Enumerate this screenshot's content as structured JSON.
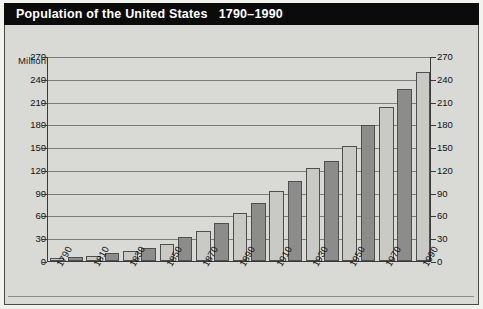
{
  "title": {
    "text": "Population of the United States   1790–1990"
  },
  "axis_unit_label": "Millions",
  "colors": {
    "title_bar_background": "#0b0b0b",
    "title_text": "#ffffff",
    "panel_background": "#d9d9d5",
    "plot_background": "#d9d9d5",
    "gridline": "#7d7d78",
    "axis_line": "#3a3a3a",
    "bar_light": "#c9c9c5",
    "bar_dark": "#8c8c8a",
    "bar_outline": "#4e4e4e",
    "tick_text": "#111111"
  },
  "chart_data": {
    "type": "bar",
    "title": "Population of the United States   1790–1990",
    "xlabel": "",
    "ylabel": "Millions",
    "ylim": [
      0,
      270
    ],
    "yticks": [
      0,
      30,
      60,
      90,
      120,
      150,
      180,
      210,
      240,
      270
    ],
    "ytick_labels": [
      "0",
      "30",
      "60",
      "90",
      "120",
      "150",
      "180",
      "210",
      "240",
      "270"
    ],
    "grid": true,
    "grid_axis": "y",
    "legend": false,
    "dual_y_axis": true,
    "right_ytick_labels": [
      "0",
      "30",
      "60",
      "90",
      "120",
      "150",
      "180",
      "210",
      "240",
      "270"
    ],
    "categories": [
      "1790",
      "1800",
      "1810",
      "1820",
      "1830",
      "1840",
      "1850",
      "1860",
      "1870",
      "1880",
      "1890",
      "1900",
      "1910",
      "1920",
      "1930",
      "1940",
      "1950",
      "1960",
      "1970",
      "1980",
      "1990"
    ],
    "xtick_labels_shown": [
      "1790",
      "1810",
      "1830",
      "1850",
      "1870",
      "1890",
      "1910",
      "1930",
      "1950",
      "1970",
      "1990"
    ],
    "xtick_label_rotation_deg": -61,
    "values": [
      4,
      5,
      7,
      10,
      13,
      17,
      23,
      31,
      39,
      50,
      63,
      76,
      92,
      106,
      123,
      132,
      151,
      179,
      203,
      227,
      249
    ],
    "bar_fill_alternating": [
      "light",
      "dark",
      "light",
      "dark",
      "light",
      "dark",
      "light",
      "dark",
      "light",
      "dark",
      "light",
      "dark",
      "light",
      "dark",
      "light",
      "dark",
      "light",
      "dark",
      "light",
      "dark",
      "light"
    ]
  }
}
